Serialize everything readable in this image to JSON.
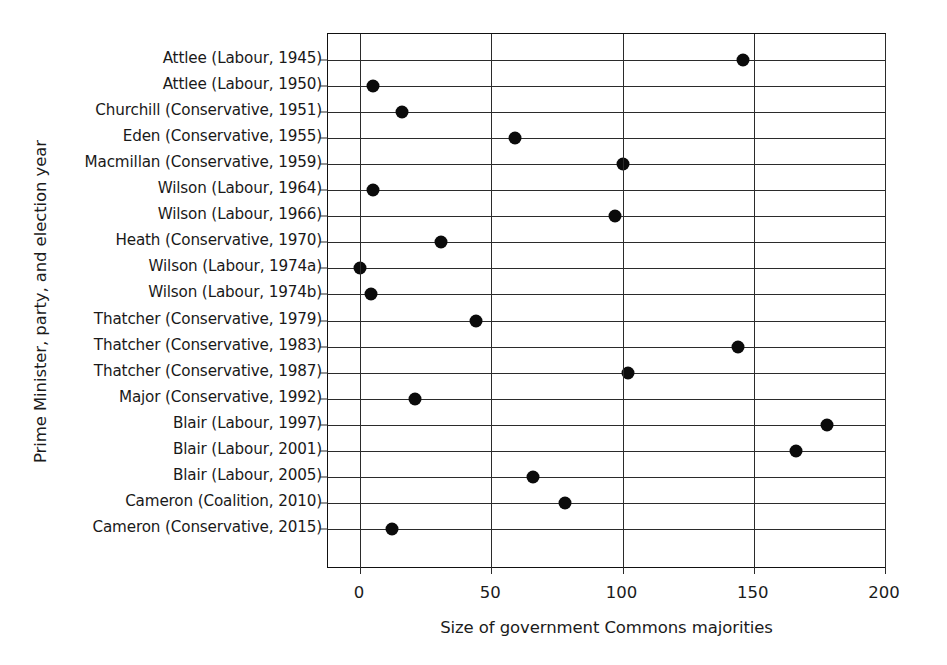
{
  "chart_data": {
    "type": "scatter",
    "title": "",
    "xlabel": "Size of government Commons majorities",
    "ylabel": "Prime Minister, party, and election year",
    "xlim": [
      -12,
      213
    ],
    "xticks": [
      0,
      50,
      100,
      150,
      200
    ],
    "xticklabels": [
      "0",
      "50",
      "100",
      "150",
      "200"
    ],
    "grid": "both",
    "legend": "none",
    "marker": "filled-circle",
    "marker_color": "#0b0b0b",
    "categories": [
      "Attlee (Labour, 1945)",
      "Attlee (Labour, 1950)",
      "Churchill (Conservative, 1951)",
      "Eden (Conservative, 1955)",
      "Macmillan (Conservative, 1959)",
      "Wilson (Labour, 1964)",
      "Wilson (Labour, 1966)",
      "Heath (Conservative, 1970)",
      "Wilson (Labour, 1974a)",
      "Wilson (Labour, 1974b)",
      "Thatcher (Conservative, 1979)",
      "Thatcher (Conservative, 1983)",
      "Thatcher (Conservative, 1987)",
      "Major (Conservative, 1992)",
      "Blair (Labour, 1997)",
      "Blair (Labour, 2001)",
      "Blair (Labour, 2005)",
      "Cameron (Coalition, 2010)",
      "Cameron (Conservative, 2015)"
    ],
    "values": [
      146,
      5,
      16,
      59,
      100,
      5,
      97,
      31,
      0,
      4,
      44,
      144,
      102,
      21,
      178,
      166,
      66,
      78,
      12
    ]
  }
}
